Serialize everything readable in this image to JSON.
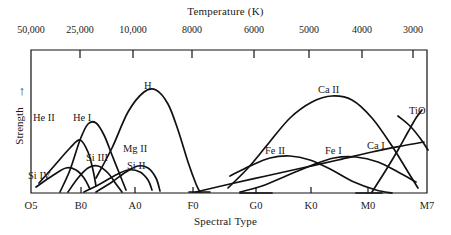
{
  "chart_data": {
    "type": "line",
    "title": "",
    "xlabel": "Spectral Type",
    "ylabel": "Strength",
    "top_axis_label": "Temperature (K)",
    "grid": false,
    "legend_position": "inline-labels",
    "top_axis_ticks": [
      "50,000",
      "25,000",
      "10,000",
      "8000",
      "6000",
      "5000",
      "4000",
      "3000"
    ],
    "top_axis_tick_x": [
      31,
      80,
      133,
      192,
      254,
      309,
      362,
      413
    ],
    "bottom_axis_ticks": [
      "O5",
      "B0",
      "A0",
      "F0",
      "G0",
      "K0",
      "M0",
      "M7"
    ],
    "bottom_axis_tick_x": [
      31,
      81,
      135,
      193,
      256,
      311,
      368,
      427
    ],
    "x_range_px": [
      31,
      427
    ],
    "y_baseline_px": 193,
    "y_top_px": 50,
    "series": [
      {
        "name": "He II",
        "label_x": 33,
        "label_y": 112,
        "points": [
          [
            39,
            183
          ],
          [
            55,
            165
          ],
          [
            70,
            148
          ],
          [
            80,
            140
          ],
          [
            88,
            152
          ],
          [
            93,
            170
          ],
          [
            96,
            186
          ]
        ]
      },
      {
        "name": "He I",
        "label_x": 73,
        "label_y": 112,
        "points": [
          [
            60,
            192
          ],
          [
            70,
            170
          ],
          [
            80,
            140
          ],
          [
            88,
            124
          ],
          [
            96,
            123
          ],
          [
            104,
            135
          ],
          [
            112,
            155
          ],
          [
            120,
            175
          ],
          [
            126,
            190
          ]
        ]
      },
      {
        "name": "Si IV",
        "label_x": 28,
        "label_y": 170,
        "points": [
          [
            36,
            187
          ],
          [
            52,
            176
          ],
          [
            66,
            168
          ],
          [
            76,
            170
          ],
          [
            84,
            178
          ],
          [
            90,
            189
          ]
        ]
      },
      {
        "name": "Si III",
        "label_x": 86,
        "label_y": 152,
        "points": [
          [
            68,
            192
          ],
          [
            78,
            178
          ],
          [
            88,
            168
          ],
          [
            98,
            166
          ],
          [
            108,
            173
          ],
          [
            116,
            184
          ],
          [
            122,
            192
          ]
        ]
      },
      {
        "name": "Si II",
        "label_x": 127,
        "label_y": 160,
        "points": [
          [
            84,
            192
          ],
          [
            100,
            184
          ],
          [
            114,
            176
          ],
          [
            128,
            170
          ],
          [
            140,
            172
          ],
          [
            148,
            180
          ],
          [
            152,
            190
          ]
        ]
      },
      {
        "name": "Mg II",
        "label_x": 123,
        "label_y": 143,
        "points": [
          [
            96,
            192
          ],
          [
            112,
            182
          ],
          [
            126,
            172
          ],
          [
            138,
            166
          ],
          [
            148,
            168
          ],
          [
            156,
            178
          ],
          [
            160,
            191
          ]
        ]
      },
      {
        "name": "H",
        "label_x": 144,
        "label_y": 80,
        "points": [
          [
            96,
            178
          ],
          [
            112,
            148
          ],
          [
            128,
            112
          ],
          [
            144,
            92
          ],
          [
            156,
            90
          ],
          [
            168,
            104
          ],
          [
            178,
            130
          ],
          [
            188,
            162
          ],
          [
            196,
            184
          ],
          [
            200,
            192
          ]
        ]
      },
      {
        "name": "Ca II",
        "label_x": 318,
        "label_y": 84,
        "points": [
          [
            228,
            188
          ],
          [
            248,
            168
          ],
          [
            268,
            144
          ],
          [
            290,
            118
          ],
          [
            312,
            102
          ],
          [
            332,
            96
          ],
          [
            352,
            100
          ],
          [
            372,
            118
          ],
          [
            392,
            146
          ],
          [
            408,
            172
          ],
          [
            418,
            188
          ]
        ]
      },
      {
        "name": "Fe II",
        "label_x": 265,
        "label_y": 145,
        "points": [
          [
            230,
            176
          ],
          [
            250,
            166
          ],
          [
            270,
            158
          ],
          [
            290,
            156
          ],
          [
            310,
            160
          ],
          [
            332,
            170
          ],
          [
            354,
            182
          ],
          [
            376,
            190
          ],
          [
            392,
            193
          ]
        ]
      },
      {
        "name": "Fe I",
        "label_x": 325,
        "label_y": 145,
        "points": [
          [
            240,
            192
          ],
          [
            262,
            186
          ],
          [
            286,
            176
          ],
          [
            310,
            166
          ],
          [
            334,
            158
          ],
          [
            356,
            157
          ],
          [
            378,
            162
          ],
          [
            398,
            172
          ],
          [
            416,
            182
          ]
        ]
      },
      {
        "name": "Ca I",
        "label_x": 367,
        "label_y": 140,
        "points": [
          [
            196,
            192
          ],
          [
            230,
            184
          ],
          [
            266,
            176
          ],
          [
            302,
            168
          ],
          [
            338,
            160
          ],
          [
            372,
            152
          ],
          [
            402,
            146
          ],
          [
            424,
            142
          ]
        ]
      },
      {
        "name": "TiO",
        "label_x": 409,
        "label_y": 105,
        "points": [
          [
            372,
            192
          ],
          [
            386,
            170
          ],
          [
            398,
            150
          ],
          [
            408,
            132
          ],
          [
            416,
            118
          ],
          [
            422,
            110
          ]
        ]
      },
      {
        "name": "TiO-branch",
        "label_x": null,
        "label_y": null,
        "points": [
          [
            398,
            116
          ],
          [
            410,
            126
          ],
          [
            420,
            138
          ],
          [
            428,
            150
          ]
        ]
      },
      {
        "name": "baseline-F0-segment",
        "label_x": null,
        "label_y": null,
        "points": [
          [
            189,
            192
          ],
          [
            210,
            192
          ]
        ]
      },
      {
        "name": "baseline-G0-segment",
        "label_x": null,
        "label_y": null,
        "points": [
          [
            240,
            193
          ],
          [
            272,
            193
          ]
        ]
      },
      {
        "name": "baseline-M0-segment",
        "label_x": null,
        "label_y": null,
        "points": [
          [
            356,
            193
          ],
          [
            382,
            193
          ]
        ]
      }
    ]
  },
  "axes": {
    "top_title": "Temperature (K)",
    "bottom_title": "Spectral Type",
    "y_title": "Strength",
    "y_arrow": "↑"
  },
  "colors": {
    "ink": "#111111",
    "background": "#ffffff"
  }
}
